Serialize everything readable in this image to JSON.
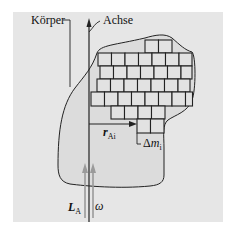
{
  "figure": {
    "labels": {
      "body": "Körper",
      "axis": "Achse",
      "position_vector": "r",
      "position_vector_sub": "Ai",
      "mass_element_prefix": "Δ",
      "mass_element": "m",
      "mass_element_sub": "i",
      "angular_momentum": "L",
      "angular_momentum_sub": "A",
      "angular_velocity": "ω"
    },
    "colors": {
      "background_panel": "#e6e6e6",
      "body_fill": "#dcdcdc",
      "line": "#222222",
      "vector_arrow": "#9a9a9a"
    },
    "grid_rows": [
      {
        "y": 40,
        "x0": 145,
        "cells": 2
      },
      {
        "y": 53,
        "x0": 98,
        "cells": 7
      },
      {
        "y": 66,
        "x0": 100,
        "cells": 7
      },
      {
        "y": 79,
        "x0": 97,
        "cells": 7
      },
      {
        "y": 92,
        "x0": 91,
        "cells": 8
      },
      {
        "y": 106,
        "x0": 111,
        "cells": 4
      },
      {
        "y": 119,
        "x0": 137,
        "cells": 2
      }
    ]
  }
}
